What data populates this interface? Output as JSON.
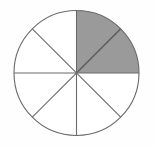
{
  "figure": {
    "name": "fraction-circle-diagram",
    "title": "Circle divided into eight equal sectors with two adjacent sectors shaded",
    "background_color": "#fefefe"
  },
  "chart_data": {
    "type": "pie",
    "title": "",
    "subtitle": "",
    "xlabel": "",
    "ylabel": "",
    "total_sectors": 8,
    "shaded_sectors": 2,
    "fraction_shaded": "2/8",
    "fraction_simplified": "1/4",
    "sector_angle_degrees": 45,
    "legend": [],
    "annotations": [],
    "categories": [
      "sector-1",
      "sector-2",
      "sector-3",
      "sector-4",
      "sector-5",
      "sector-6",
      "sector-7",
      "sector-8"
    ],
    "values": [
      12.5,
      12.5,
      12.5,
      12.5,
      12.5,
      12.5,
      12.5,
      12.5
    ],
    "sectors": [
      {
        "id": "sector-1",
        "start_deg": 0,
        "end_deg": 45,
        "shaded": true,
        "fill": "#9a9a9a"
      },
      {
        "id": "sector-2",
        "start_deg": 45,
        "end_deg": 90,
        "shaded": true,
        "fill": "#9a9a9a"
      },
      {
        "id": "sector-3",
        "start_deg": 90,
        "end_deg": 135,
        "shaded": false,
        "fill": "#ffffff"
      },
      {
        "id": "sector-4",
        "start_deg": 135,
        "end_deg": 180,
        "shaded": false,
        "fill": "#ffffff"
      },
      {
        "id": "sector-5",
        "start_deg": 180,
        "end_deg": 225,
        "shaded": false,
        "fill": "#ffffff"
      },
      {
        "id": "sector-6",
        "start_deg": 225,
        "end_deg": 270,
        "shaded": false,
        "fill": "#ffffff"
      },
      {
        "id": "sector-7",
        "start_deg": 270,
        "end_deg": 315,
        "shaded": false,
        "fill": "#ffffff"
      },
      {
        "id": "sector-8",
        "start_deg": 315,
        "end_deg": 360,
        "shaded": false,
        "fill": "#ffffff"
      }
    ],
    "geometry": {
      "center_x": 76.5,
      "center_y": 73.0,
      "radius": 62.5
    },
    "colors": {
      "shaded_fill": "#9a9a9a",
      "unshaded_fill": "#ffffff",
      "outline": "#6b6b6b",
      "divider": "#6b6b6b",
      "shaded_divider": "#4a4a4a",
      "background": "#fefefe"
    },
    "stroke_width": 1.1
  }
}
